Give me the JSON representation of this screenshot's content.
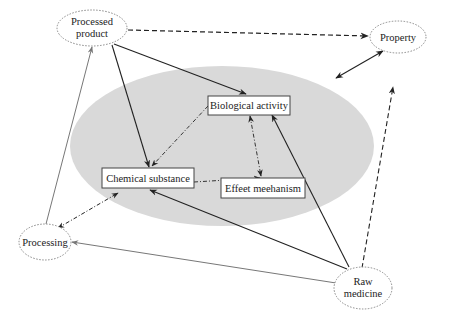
{
  "diagram": {
    "outer_nodes": [
      {
        "id": "processed_product",
        "lines": [
          "Processed",
          "product"
        ]
      },
      {
        "id": "property",
        "lines": [
          "Property"
        ]
      },
      {
        "id": "processing",
        "lines": [
          "Processing"
        ]
      },
      {
        "id": "raw_medicine",
        "lines": [
          "Raw",
          "medicine"
        ]
      }
    ],
    "inner_nodes": [
      {
        "id": "biological_activity",
        "label": "Biological activity"
      },
      {
        "id": "chemical_substance",
        "label": "Chemical substance"
      },
      {
        "id": "effect_mechanism",
        "label": "Effeet meehanism"
      }
    ],
    "edges": [
      {
        "from": "processed_product",
        "to": "property",
        "style": "dashed",
        "direction": "forward"
      },
      {
        "from": "processed_product",
        "to": "biological_activity",
        "style": "solid",
        "direction": "forward"
      },
      {
        "from": "processed_product",
        "to": "chemical_substance",
        "style": "solid",
        "direction": "forward"
      },
      {
        "from": "processing",
        "to": "processed_product",
        "style": "solid-gray",
        "direction": "forward"
      },
      {
        "from": "processing",
        "to": "core_region",
        "style": "dash-dot",
        "direction": "both"
      },
      {
        "from": "property",
        "to": "core_region",
        "style": "solid",
        "direction": "both"
      },
      {
        "from": "raw_medicine",
        "to": "property",
        "style": "dashed",
        "direction": "forward"
      },
      {
        "from": "raw_medicine",
        "to": "biological_activity",
        "style": "solid",
        "direction": "forward"
      },
      {
        "from": "raw_medicine",
        "to": "chemical_substance",
        "style": "solid",
        "direction": "forward"
      },
      {
        "from": "raw_medicine",
        "to": "processing",
        "style": "solid-gray",
        "direction": "forward"
      },
      {
        "from": "biological_activity",
        "to": "chemical_substance",
        "style": "dash-dot",
        "direction": "forward"
      },
      {
        "from": "chemical_substance",
        "to": "effect_mechanism",
        "style": "dash-dot",
        "direction": "forward"
      },
      {
        "from": "biological_activity",
        "to": "effect_mechanism",
        "style": "dash-dot",
        "direction": "both"
      }
    ],
    "colors": {
      "core_region": "#d9d9d9",
      "line_dark": "#2a2a2a",
      "line_gray": "#777777",
      "node_border": "#888888"
    }
  }
}
